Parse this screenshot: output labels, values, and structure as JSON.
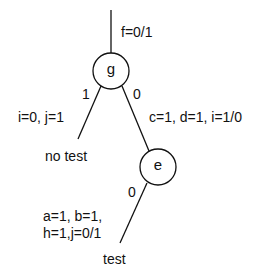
{
  "diagram": {
    "nodes": [
      {
        "id": "g",
        "label": "g"
      },
      {
        "id": "e",
        "label": "e"
      }
    ],
    "root_edge": {
      "label": "f=0/1"
    },
    "edges": [
      {
        "from": "g",
        "to": "no_test",
        "branch": "1",
        "label": "i=0, j=1"
      },
      {
        "from": "g",
        "to": "e",
        "branch": "0",
        "label": "c=1, d=1, i=1/0"
      },
      {
        "from": "e",
        "to": "test",
        "branch": "0",
        "label_line1": "a=1, b=1,",
        "label_line2": "h=1,j=0/1"
      }
    ],
    "leaves": [
      {
        "id": "no_test",
        "label": "no test"
      },
      {
        "id": "test",
        "label": "test"
      }
    ]
  }
}
